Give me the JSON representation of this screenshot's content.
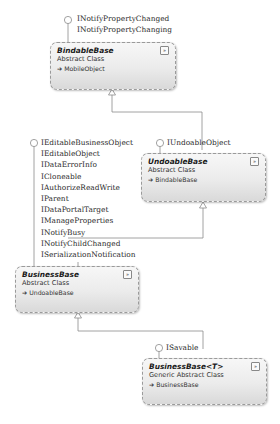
{
  "diagram": {
    "classes": [
      {
        "id": "bindable",
        "name": "BindableBase",
        "kind": "Abstract Class",
        "base": "MobileObject",
        "expander": "»"
      },
      {
        "id": "undoable",
        "name": "UndoableBase",
        "kind": "Abstract Class",
        "base": "BindableBase",
        "expander": "»"
      },
      {
        "id": "business",
        "name": "BusinessBase",
        "kind": "Abstract Class",
        "base": "UndoableBase",
        "expander": "»"
      },
      {
        "id": "businessT",
        "name": "BusinessBase<T>",
        "kind": "Generic Abstract Class",
        "base": "BusinessBase",
        "expander": "»"
      }
    ],
    "interfaces": {
      "bindable": [
        "INotifyPropertyChanged",
        "INotifyPropertyChanging"
      ],
      "undoable": [
        "IUndoableObject"
      ],
      "business": [
        "IEditableBusinessObject",
        "IEditableObject",
        "IDataErrorInfo",
        "ICloneable",
        "IAuthorizeReadWrite",
        "IParent",
        "IDataPortalTarget",
        "IManageProperties",
        "INotifyBusy",
        "INotifyChildChanged",
        "ISerializationNotification"
      ],
      "businessT": [
        "ISavable"
      ]
    },
    "inherit_arrow_glyph": "➔",
    "caption": ""
  }
}
